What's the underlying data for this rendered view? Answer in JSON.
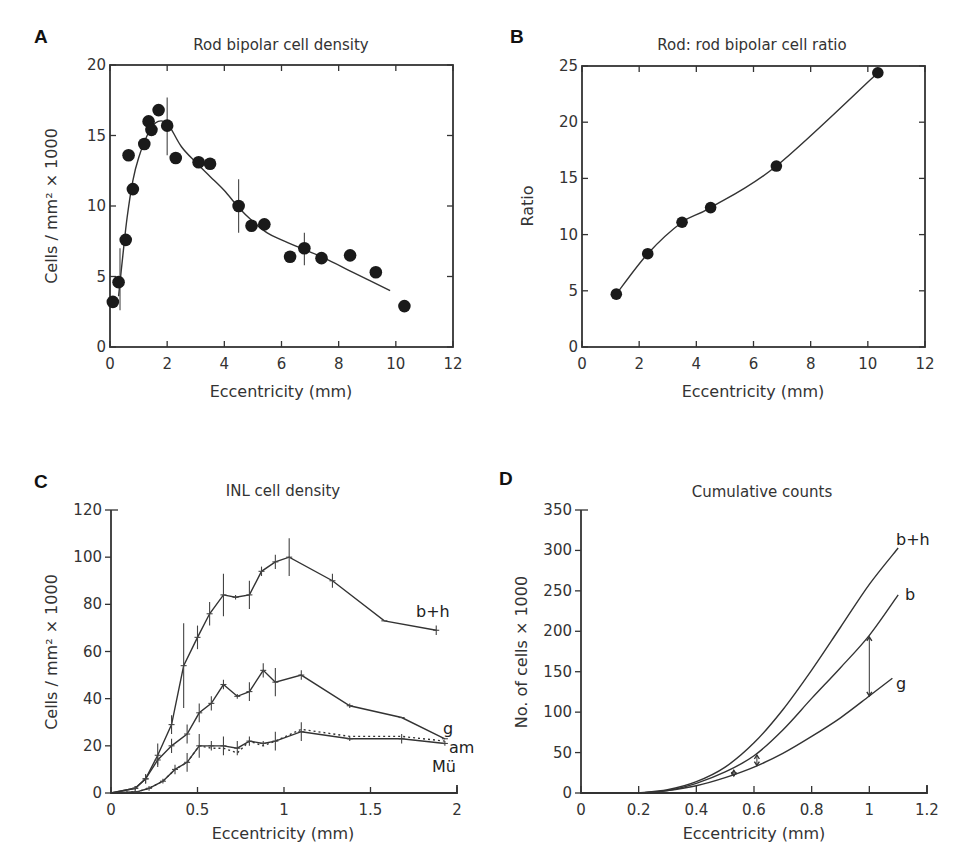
{
  "figure": {
    "panels": [
      {
        "letter": "A",
        "title": "Rod bipolar cell density",
        "xlabel": "Eccentricity (mm)",
        "ylabel": "Cells / mm² × 1000"
      },
      {
        "letter": "B",
        "title": "Rod: rod bipolar cell ratio",
        "xlabel": "Eccentricity (mm)",
        "ylabel": "Ratio"
      },
      {
        "letter": "C",
        "title": "INL cell density",
        "xlabel": "Eccentricity (mm)",
        "ylabel": "Cells / mm² × 1000"
      },
      {
        "letter": "D",
        "title": "Cumulative counts",
        "xlabel": "Eccentricity (mm)",
        "ylabel": "No. of cells × 1000"
      }
    ]
  },
  "chart_data": [
    {
      "panel": "A",
      "type": "scatter",
      "title": "Rod bipolar cell density",
      "xlabel": "Eccentricity (mm)",
      "ylabel": "Cells / mm² × 1000",
      "xlim": [
        0,
        12
      ],
      "ylim": [
        0,
        20
      ],
      "xticks": [
        0,
        2,
        4,
        6,
        8,
        10,
        12
      ],
      "yticks": [
        0,
        5,
        10,
        15,
        20
      ],
      "grid": false,
      "frame": "box",
      "points": {
        "x": [
          0.1,
          0.3,
          0.55,
          0.65,
          0.8,
          1.2,
          1.35,
          1.45,
          1.7,
          2.0,
          2.3,
          3.1,
          3.5,
          4.5,
          4.95,
          5.4,
          6.3,
          6.8,
          7.4,
          8.4,
          9.3,
          10.3
        ],
        "y": [
          3.2,
          4.6,
          7.6,
          13.6,
          11.2,
          14.4,
          16.0,
          15.4,
          16.8,
          15.7,
          13.4,
          13.1,
          13.0,
          10.0,
          8.6,
          8.7,
          6.4,
          7.0,
          6.3,
          6.5,
          5.3,
          2.9
        ]
      },
      "error_bars": [
        {
          "x": 0.35,
          "y_low": 2.6,
          "y_high": 7.0
        },
        {
          "x": 2.0,
          "y_low": 13.6,
          "y_high": 17.7
        },
        {
          "x": 4.5,
          "y_low": 8.1,
          "y_high": 11.9
        },
        {
          "x": 6.8,
          "y_low": 5.8,
          "y_high": 8.1
        }
      ],
      "fit_curve": {
        "x": [
          0.3,
          0.45,
          0.6,
          0.8,
          1.0,
          1.3,
          1.6,
          1.9,
          2.1,
          2.5,
          3.0,
          3.5,
          4.0,
          4.5,
          5.0,
          5.5,
          6.0,
          6.8,
          7.5,
          8.5,
          9.8
        ],
        "y": [
          3.6,
          6.5,
          9.2,
          11.8,
          13.4,
          15.0,
          15.9,
          16.0,
          15.6,
          14.2,
          13.1,
          12.1,
          11.1,
          9.9,
          8.9,
          8.1,
          7.6,
          6.9,
          6.3,
          5.3,
          4.0
        ]
      }
    },
    {
      "panel": "B",
      "type": "line",
      "title": "Rod: rod bipolar cell ratio",
      "xlabel": "Eccentricity (mm)",
      "ylabel": "Ratio",
      "xlim": [
        0,
        12
      ],
      "ylim": [
        0,
        25
      ],
      "xticks": [
        0,
        2,
        4,
        6,
        8,
        10,
        12
      ],
      "yticks": [
        0,
        5,
        10,
        15,
        20,
        25
      ],
      "grid": false,
      "frame": "box",
      "points": {
        "x": [
          1.2,
          2.3,
          3.5,
          4.5,
          6.8,
          10.35
        ],
        "y": [
          4.7,
          8.3,
          11.1,
          12.4,
          16.1,
          24.4
        ]
      }
    },
    {
      "panel": "C",
      "type": "line",
      "title": "INL cell density",
      "xlabel": "Eccentricity (mm)",
      "ylabel": "Cells / mm² × 1000",
      "xlim": [
        0,
        2
      ],
      "ylim": [
        0,
        120
      ],
      "xticks": [
        0,
        0.5,
        1,
        1.5,
        2
      ],
      "yticks": [
        0,
        20,
        40,
        60,
        80,
        100,
        120
      ],
      "grid": false,
      "frame": "open",
      "series": [
        {
          "name": "b+h",
          "x": [
            0,
            0.14,
            0.2,
            0.27,
            0.35,
            0.42,
            0.5,
            0.57,
            0.65,
            0.72,
            0.8,
            0.87,
            0.95,
            1.03,
            1.28,
            1.58,
            1.88
          ],
          "y": [
            0,
            2,
            6,
            16,
            29,
            54,
            66,
            76,
            84,
            83,
            84,
            94,
            98,
            100,
            90,
            73,
            69
          ],
          "err": [
            0,
            1,
            2,
            5,
            4,
            18,
            5,
            5,
            9,
            1,
            6,
            2,
            3,
            8,
            3,
            0,
            2
          ]
        },
        {
          "name": "g",
          "x": [
            0,
            0.14,
            0.2,
            0.27,
            0.35,
            0.44,
            0.51,
            0.58,
            0.65,
            0.73,
            0.8,
            0.88,
            0.95,
            1.1,
            1.38,
            1.68,
            1.93
          ],
          "y": [
            0,
            2,
            6,
            14,
            20,
            25,
            34,
            38,
            46,
            41,
            43,
            52,
            47,
            50,
            37,
            32,
            23
          ],
          "err": [
            0,
            1,
            2,
            2,
            3,
            4,
            4,
            3,
            2,
            1,
            4,
            3,
            6,
            2,
            1,
            0,
            0
          ]
        },
        {
          "name": "am",
          "x": [
            0,
            0.15,
            0.22,
            0.3,
            0.37,
            0.44,
            0.51,
            0.58,
            0.65,
            0.73,
            0.8,
            0.88,
            0.95,
            1.1,
            1.38,
            1.68,
            1.93
          ],
          "y": [
            0,
            0.5,
            2,
            5,
            10,
            13,
            20,
            19,
            19,
            17,
            22,
            20,
            22,
            27,
            24,
            24,
            22
          ],
          "dashed": true
        },
        {
          "name": "Mü",
          "x": [
            0,
            0.15,
            0.22,
            0.3,
            0.37,
            0.44,
            0.51,
            0.58,
            0.65,
            0.73,
            0.8,
            0.88,
            0.95,
            1.1,
            1.38,
            1.68,
            1.93
          ],
          "y": [
            0,
            0.5,
            2,
            5,
            10,
            13,
            20,
            20,
            20,
            19,
            22,
            21,
            22,
            26,
            23,
            23,
            21
          ],
          "err": [
            0,
            0,
            1,
            1,
            2,
            4,
            5,
            2,
            4,
            3,
            2,
            1,
            4,
            4,
            1,
            2,
            1
          ]
        }
      ],
      "legend": "inline labels at right end"
    },
    {
      "panel": "D",
      "type": "line",
      "title": "Cumulative counts",
      "xlabel": "Eccentricity (mm)",
      "ylabel": "No. of cells × 1000",
      "xlim": [
        0,
        1.2
      ],
      "ylim": [
        0,
        350
      ],
      "xticks": [
        0,
        0.2,
        0.4,
        0.6,
        0.8,
        1,
        1.2
      ],
      "yticks": [
        0,
        50,
        100,
        150,
        200,
        250,
        300,
        350
      ],
      "grid": false,
      "frame": "open",
      "series": [
        {
          "name": "b+h",
          "x": [
            0.2,
            0.3,
            0.4,
            0.5,
            0.6,
            0.7,
            0.8,
            0.9,
            1.0,
            1.1
          ],
          "y": [
            0,
            4,
            14,
            32,
            62,
            103,
            152,
            205,
            258,
            303
          ]
        },
        {
          "name": "b",
          "x": [
            0.2,
            0.3,
            0.4,
            0.5,
            0.6,
            0.7,
            0.8,
            0.9,
            1.0,
            1.1
          ],
          "y": [
            0,
            3,
            12,
            26,
            46,
            78,
            117,
            155,
            195,
            245
          ]
        },
        {
          "name": "g",
          "x": [
            0.2,
            0.3,
            0.4,
            0.5,
            0.6,
            0.7,
            0.8,
            0.9,
            1.0,
            1.08
          ],
          "y": [
            0,
            3,
            9,
            19,
            32,
            49,
            70,
            93,
            120,
            142
          ]
        }
      ],
      "annotations": [
        {
          "type": "double-arrow",
          "x": 0.53,
          "y_low": 21,
          "y_high": 28
        },
        {
          "type": "double-arrow",
          "x": 0.61,
          "y_low": 34,
          "y_high": 47
        },
        {
          "type": "double-arrow",
          "x": 1.0,
          "y_low": 120,
          "y_high": 193
        }
      ],
      "legend": "inline labels at right end"
    }
  ]
}
